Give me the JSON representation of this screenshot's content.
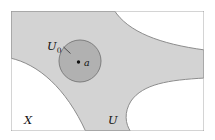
{
  "figure": {
    "kind": "topology-neighborhood-diagram",
    "width": 215,
    "height": 140,
    "background_color": "#ffffff",
    "frame": {
      "name": "ambient-space-box",
      "x": 11,
      "y": 11,
      "width": 193,
      "height": 120,
      "stroke_color": "#9a9a9a",
      "stroke_width": 1,
      "fill_color": "#ffffff"
    },
    "regions": [
      {
        "name": "open-set-U",
        "role": "open set U, shaded light gray, spans the box with three white lobes intruding",
        "fill_color": "#d3d3d3",
        "stroke_color": "#8c8c8c",
        "stroke_width": 1
      },
      {
        "name": "neighborhood-U0",
        "role": "smaller open neighborhood U0 of the point a, darker gray disc",
        "fill_color": "#b1b1b1",
        "stroke_color": "#7e7e7e",
        "stroke_width": 1,
        "center_x": 80,
        "center_y": 61,
        "radius": 21
      }
    ],
    "point": {
      "name": "point-a",
      "x": 78.5,
      "y": 62,
      "radius": 1.7,
      "color": "#111111"
    },
    "leader_line": {
      "name": "U0-leader-line",
      "from_x": 63.5,
      "from_y": 47,
      "to_x": 70.5,
      "to_y": 53.5,
      "stroke_color": "#333333",
      "stroke_width": 0.8
    },
    "labels": {
      "neighborhood": {
        "name": "label-U0",
        "base": "U",
        "subscript": "0",
        "x": 47,
        "y": 50
      },
      "point": {
        "name": "label-a",
        "text": "a",
        "x": 84,
        "y": 65.5
      },
      "space": {
        "name": "label-X",
        "text": "X",
        "x": 24,
        "y": 124
      },
      "open_set": {
        "name": "label-U",
        "text": "U",
        "x": 108,
        "y": 124
      }
    }
  }
}
